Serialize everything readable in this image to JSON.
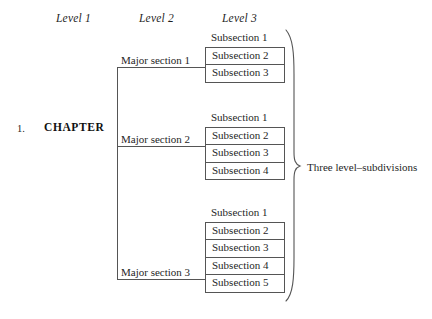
{
  "headers": {
    "level1": "Level 1",
    "level2": "Level 2",
    "level3": "Level 3"
  },
  "level1": {
    "number": "1.",
    "label": "CHAPTER"
  },
  "level2": [
    {
      "label": "Major section 1"
    },
    {
      "label": "Major section 2"
    },
    {
      "label": "Major section 3"
    }
  ],
  "level3_groups": [
    {
      "parent": "Major section 1",
      "items": [
        "Subsection 1",
        "Subsection 2",
        "Subsection 3"
      ]
    },
    {
      "parent": "Major section 2",
      "items": [
        "Subsection 1",
        "Subsection 2",
        "Subsection 3",
        "Subsection 4"
      ]
    },
    {
      "parent": "Major section 3",
      "items": [
        "Subsection 1",
        "Subsection 2",
        "Subsection 3",
        "Subsection 4",
        "Subsection 5"
      ]
    }
  ],
  "annotation": {
    "brace_label": "Three level–subdivisions"
  },
  "colors": {
    "text": "#1f1f1f",
    "rule": "#555555",
    "background": "#ffffff"
  }
}
